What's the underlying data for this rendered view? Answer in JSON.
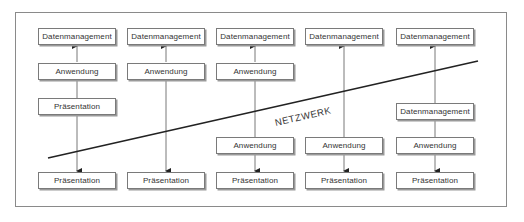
{
  "diagram": {
    "network_label": "NETZWERK",
    "columns": [
      {
        "id": 1,
        "above_network": [
          "Datenmanagement",
          "Anwendung",
          "Präsentation"
        ],
        "below_network": [
          "Präsentation"
        ]
      },
      {
        "id": 2,
        "above_network": [
          "Datenmanagement",
          "Anwendung"
        ],
        "below_network": [
          "Präsentation"
        ]
      },
      {
        "id": 3,
        "above_network": [
          "Datenmanagement",
          "Anwendung"
        ],
        "below_network": [
          "Anwendung",
          "Präsentation"
        ]
      },
      {
        "id": 4,
        "above_network": [
          "Datenmanagement"
        ],
        "below_network": [
          "Anwendung",
          "Präsentation"
        ]
      },
      {
        "id": 5,
        "above_network": [
          "Datenmanagement"
        ],
        "below_network": [
          "Datenmanagement",
          "Anwendung",
          "Präsentation"
        ]
      }
    ],
    "colors": {
      "frame": "#8a8a8a",
      "box_border": "#7a7a7a",
      "network_line": "#222222",
      "connector": "#555555",
      "text": "#333333"
    }
  }
}
